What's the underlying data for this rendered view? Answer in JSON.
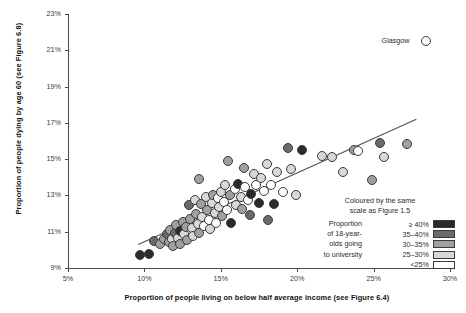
{
  "chart_data": {
    "type": "scatter",
    "title": "",
    "xlabel": "Proportion of people living on below half average income (see Figure 6.4)",
    "ylabel": "Proportion of people dying by age 60 (see Figure 6.8)",
    "xlim": [
      5,
      30
    ],
    "ylim": [
      9,
      23
    ],
    "xticks": [
      "5%",
      "10%",
      "15%",
      "20%",
      "25%",
      "30%"
    ],
    "xtick_values": [
      5,
      10,
      15,
      20,
      25,
      30
    ],
    "yticks": [
      "9%",
      "11%",
      "13%",
      "15%",
      "17%",
      "19%",
      "21%",
      "23%"
    ],
    "ytick_values": [
      9,
      11,
      13,
      15,
      17,
      19,
      21,
      23
    ],
    "grid": false,
    "legend_position": "bottom-right",
    "colour_bins": [
      {
        "label": "≥ 40%",
        "hex": "#2b2b2b"
      },
      {
        "label": "35–40%",
        "hex": "#6a6a6a"
      },
      {
        "label": "30–35%",
        "hex": "#a0a0a0"
      },
      {
        "label": "25–30%",
        "hex": "#d8d8d8"
      },
      {
        "label": "<25%",
        "hex": "#ffffff"
      }
    ],
    "annotations": [
      {
        "text": "Glasgow",
        "x": 28.4,
        "y": 21.5
      }
    ],
    "trendline": {
      "x0": 9.6,
      "y0": 10.3,
      "x1": 27.8,
      "y1": 17.2
    },
    "points": [
      {
        "x": 9.7,
        "y": 9.7,
        "c": 0
      },
      {
        "x": 10.3,
        "y": 9.75,
        "c": 0
      },
      {
        "x": 10.6,
        "y": 10.5,
        "c": 1
      },
      {
        "x": 11.0,
        "y": 10.35,
        "c": 2
      },
      {
        "x": 11.3,
        "y": 10.6,
        "c": 2
      },
      {
        "x": 11.5,
        "y": 10.85,
        "c": 1
      },
      {
        "x": 11.6,
        "y": 10.45,
        "c": 2
      },
      {
        "x": 11.7,
        "y": 11.1,
        "c": 2
      },
      {
        "x": 11.8,
        "y": 10.6,
        "c": 3
      },
      {
        "x": 11.9,
        "y": 10.2,
        "c": 2
      },
      {
        "x": 12.0,
        "y": 10.95,
        "c": 1
      },
      {
        "x": 12.1,
        "y": 11.35,
        "c": 2
      },
      {
        "x": 12.2,
        "y": 10.65,
        "c": 3
      },
      {
        "x": 12.3,
        "y": 11.05,
        "c": 0
      },
      {
        "x": 12.35,
        "y": 10.3,
        "c": 2
      },
      {
        "x": 12.5,
        "y": 11.55,
        "c": 2
      },
      {
        "x": 12.6,
        "y": 10.9,
        "c": 3
      },
      {
        "x": 12.7,
        "y": 11.25,
        "c": 2
      },
      {
        "x": 12.8,
        "y": 10.55,
        "c": 2
      },
      {
        "x": 12.9,
        "y": 12.45,
        "c": 1
      },
      {
        "x": 13.0,
        "y": 11.7,
        "c": 2
      },
      {
        "x": 13.1,
        "y": 11.2,
        "c": 3
      },
      {
        "x": 13.15,
        "y": 10.75,
        "c": 3
      },
      {
        "x": 13.3,
        "y": 12.75,
        "c": 3
      },
      {
        "x": 13.4,
        "y": 11.95,
        "c": 2
      },
      {
        "x": 13.5,
        "y": 11.4,
        "c": 3
      },
      {
        "x": 13.55,
        "y": 10.95,
        "c": 2
      },
      {
        "x": 13.7,
        "y": 12.55,
        "c": 2
      },
      {
        "x": 13.8,
        "y": 11.8,
        "c": 3
      },
      {
        "x": 13.9,
        "y": 11.3,
        "c": 4
      },
      {
        "x": 13.6,
        "y": 13.9,
        "c": 2
      },
      {
        "x": 14.0,
        "y": 12.9,
        "c": 3
      },
      {
        "x": 14.1,
        "y": 12.2,
        "c": 2
      },
      {
        "x": 14.2,
        "y": 11.65,
        "c": 4
      },
      {
        "x": 14.3,
        "y": 11.15,
        "c": 3
      },
      {
        "x": 14.4,
        "y": 12.6,
        "c": 3
      },
      {
        "x": 14.5,
        "y": 13.0,
        "c": 2
      },
      {
        "x": 14.6,
        "y": 12.05,
        "c": 3
      },
      {
        "x": 14.7,
        "y": 11.5,
        "c": 4
      },
      {
        "x": 14.8,
        "y": 12.85,
        "c": 4
      },
      {
        "x": 14.9,
        "y": 12.35,
        "c": 3
      },
      {
        "x": 15.0,
        "y": 13.2,
        "c": 3
      },
      {
        "x": 15.1,
        "y": 11.85,
        "c": 2
      },
      {
        "x": 15.2,
        "y": 12.65,
        "c": 4
      },
      {
        "x": 15.3,
        "y": 13.55,
        "c": 3
      },
      {
        "x": 15.4,
        "y": 12.2,
        "c": 4
      },
      {
        "x": 15.5,
        "y": 14.9,
        "c": 2
      },
      {
        "x": 15.6,
        "y": 13.0,
        "c": 2
      },
      {
        "x": 15.7,
        "y": 11.5,
        "c": 0
      },
      {
        "x": 15.9,
        "y": 13.35,
        "c": 4
      },
      {
        "x": 16.0,
        "y": 12.5,
        "c": 3
      },
      {
        "x": 16.1,
        "y": 13.65,
        "c": 0
      },
      {
        "x": 16.3,
        "y": 12.9,
        "c": 3
      },
      {
        "x": 16.4,
        "y": 12.25,
        "c": 2
      },
      {
        "x": 16.5,
        "y": 14.5,
        "c": 2
      },
      {
        "x": 16.6,
        "y": 13.45,
        "c": 4
      },
      {
        "x": 16.8,
        "y": 12.75,
        "c": 4
      },
      {
        "x": 16.9,
        "y": 11.9,
        "c": 1
      },
      {
        "x": 17.0,
        "y": 13.1,
        "c": 0
      },
      {
        "x": 17.2,
        "y": 14.2,
        "c": 3
      },
      {
        "x": 17.3,
        "y": 13.55,
        "c": 4
      },
      {
        "x": 17.5,
        "y": 12.6,
        "c": 0
      },
      {
        "x": 17.6,
        "y": 13.95,
        "c": 3
      },
      {
        "x": 17.8,
        "y": 13.25,
        "c": 4
      },
      {
        "x": 18.0,
        "y": 14.75,
        "c": 3
      },
      {
        "x": 18.1,
        "y": 11.65,
        "c": 1
      },
      {
        "x": 18.3,
        "y": 13.6,
        "c": 4
      },
      {
        "x": 18.5,
        "y": 12.55,
        "c": 0
      },
      {
        "x": 18.7,
        "y": 14.3,
        "c": 3
      },
      {
        "x": 19.1,
        "y": 13.2,
        "c": 4
      },
      {
        "x": 19.4,
        "y": 15.6,
        "c": 1
      },
      {
        "x": 19.6,
        "y": 14.45,
        "c": 3
      },
      {
        "x": 19.9,
        "y": 13.0,
        "c": 3
      },
      {
        "x": 20.3,
        "y": 15.5,
        "c": 0
      },
      {
        "x": 21.6,
        "y": 15.15,
        "c": 3
      },
      {
        "x": 22.3,
        "y": 15.1,
        "c": 3
      },
      {
        "x": 23.0,
        "y": 14.3,
        "c": 3
      },
      {
        "x": 23.7,
        "y": 15.5,
        "c": 2
      },
      {
        "x": 24.0,
        "y": 15.45,
        "c": 4
      },
      {
        "x": 24.9,
        "y": 13.85,
        "c": 2
      },
      {
        "x": 25.4,
        "y": 15.9,
        "c": 1
      },
      {
        "x": 25.7,
        "y": 15.1,
        "c": 3
      },
      {
        "x": 27.2,
        "y": 15.85,
        "c": 2
      },
      {
        "x": 28.4,
        "y": 21.5,
        "c": 4
      }
    ]
  },
  "legend": {
    "header_line1": "Coloured by the same",
    "header_line2": "scale as Figure 1.5",
    "caption_lines": [
      "Proportion",
      "of 18-year-",
      "olds going",
      "to university"
    ]
  }
}
